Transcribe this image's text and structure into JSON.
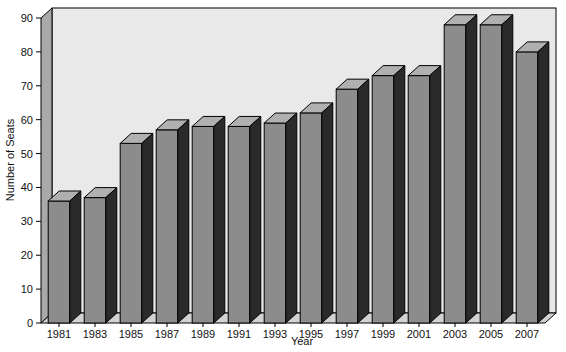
{
  "chart_data": {
    "type": "bar",
    "title": "",
    "subtitle": "",
    "xlabel": "Year",
    "ylabel": "Number of Seats",
    "categories": [
      "1981",
      "1983",
      "1985",
      "1987",
      "1989",
      "1991",
      "1993",
      "1995",
      "1997",
      "1999",
      "2001",
      "2003",
      "2005",
      "2007"
    ],
    "values": [
      36,
      37,
      53,
      57,
      58,
      58,
      59,
      62,
      69,
      73,
      73,
      88,
      88,
      80
    ],
    "ylim": [
      0,
      90
    ],
    "yticks": [
      0,
      10,
      20,
      30,
      40,
      50,
      60,
      70,
      80,
      90
    ],
    "ytick_labels": [
      "0",
      "10",
      "20",
      "30",
      "40",
      "50",
      "60",
      "70",
      "80",
      "90"
    ],
    "grid": false,
    "legend": null,
    "style": "3d-bars",
    "colors": {
      "bar_front": "#8c8c8c",
      "bar_top": "#b0b0b0",
      "bar_side": "#2a2a2a",
      "plot_background": "#e8e8e8",
      "wall_side": "#a8a8a8",
      "floor_top": "#d0d0d0",
      "axis": "#000000",
      "text": "#111111"
    }
  },
  "axes": {
    "y_title": "Number of Seats",
    "x_title": "Year"
  }
}
